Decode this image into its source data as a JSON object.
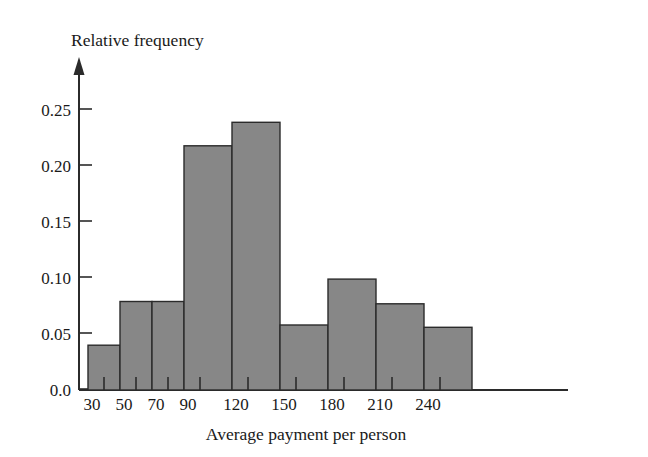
{
  "figure": {
    "background_color": "#ffffff",
    "axis_color": "#2b2b2b",
    "bar_fill_color": "#878787",
    "bar_edge_color": "#2b2b2b"
  },
  "chart_data": {
    "type": "bar",
    "title": "",
    "subtitle": "",
    "xlabel": "Average payment per person",
    "ylabel": "Relative frequency",
    "grid": false,
    "legend": null,
    "ylim": [
      0.0,
      0.268
    ],
    "ytick_labels": [
      "0.0",
      "0.05",
      "0.10",
      "0.15",
      "0.20",
      "0.25"
    ],
    "ytick_values": [
      0.0,
      0.05,
      0.1,
      0.15,
      0.2,
      0.25
    ],
    "xtick_labels": [
      "30",
      "50",
      "70",
      "90",
      "120",
      "150",
      "180",
      "210",
      "240"
    ],
    "xtick_values": [
      30,
      50,
      70,
      90,
      120,
      150,
      180,
      210,
      240
    ],
    "bin_edges": [
      30,
      50,
      70,
      90,
      120,
      150,
      180,
      210,
      240,
      255
    ],
    "categories": [
      "30-50",
      "50-70",
      "70-90",
      "90-120",
      "120-150",
      "150-180",
      "180-210",
      "210-240",
      "240-255"
    ],
    "values": [
      0.04,
      0.079,
      0.079,
      0.218,
      0.239,
      0.058,
      0.099,
      0.077,
      0.056
    ],
    "series": [
      {
        "name": "Relative frequency",
        "values": [
          0.04,
          0.079,
          0.079,
          0.218,
          0.239,
          0.058,
          0.099,
          0.077,
          0.056
        ]
      }
    ],
    "bars": [
      {
        "label": "30-50",
        "x0": 30,
        "x1": 50,
        "value": 0.04
      },
      {
        "label": "50-70",
        "x0": 50,
        "x1": 70,
        "value": 0.079
      },
      {
        "label": "70-90",
        "x0": 70,
        "x1": 90,
        "value": 0.079
      },
      {
        "label": "90-120",
        "x0": 90,
        "x1": 120,
        "value": 0.218
      },
      {
        "label": "120-150",
        "x0": 120,
        "x1": 150,
        "value": 0.239
      },
      {
        "label": "150-180",
        "x0": 150,
        "x1": 180,
        "value": 0.058
      },
      {
        "label": "180-210",
        "x0": 180,
        "x1": 210,
        "value": 0.099
      },
      {
        "label": "210-240",
        "x0": 210,
        "x1": 240,
        "value": 0.077
      },
      {
        "label": "240-255",
        "x0": 240,
        "x1": 255,
        "value": 0.056
      }
    ]
  }
}
